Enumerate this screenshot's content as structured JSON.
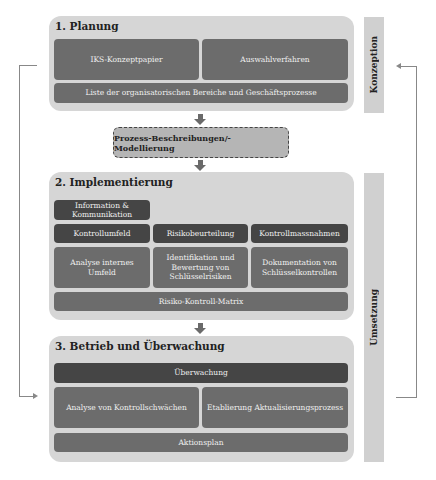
{
  "side_labels": {
    "konzeption": "Konzeption",
    "umsetzung": "Umsetzung"
  },
  "phase1": {
    "title": "1. Planung",
    "items": [
      "IKS-Konzeptpapier",
      "Auswahlverfahren"
    ],
    "bottom": "Liste der organisatorischen Bereiche und Geschäftsprozesse"
  },
  "process": {
    "label": "Prozess-Beschreibungen/-Modellierung"
  },
  "phase2": {
    "title": "2. Implementierung",
    "info": "Information & Kommunikation",
    "headers": [
      "Kontrollumfeld",
      "Risikobeurteilung",
      "Kontrollmassnahmen"
    ],
    "details": [
      "Analyse internes Umfeld",
      "Identifikation und Bewertung von Schlüsselrisiken",
      "Dokumentation von Schlüsselkontrollen"
    ],
    "bottom": "Risiko-Kontroll-Matrix"
  },
  "phase3": {
    "title": "3. Betrieb und Überwachung",
    "top": "Überwachung",
    "items": [
      "Analyse von Kontrollschwächen",
      "Etablierung Aktualisierungsprozess"
    ],
    "bottom": "Aktionsplan"
  },
  "colors": {
    "panel": "#d6d6d6",
    "dark_box": "#454545",
    "mid_box": "#6c6c6c",
    "side_bar": "#d0d0d0",
    "process_box": "#b5b5b5"
  }
}
